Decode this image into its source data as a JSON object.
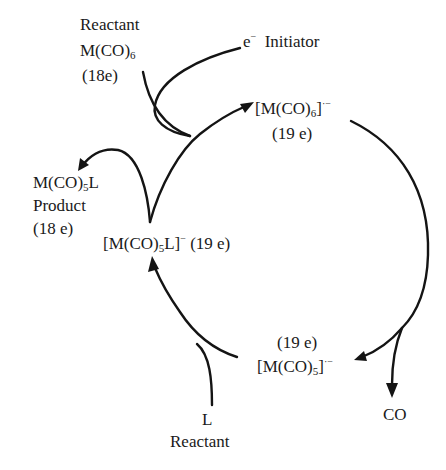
{
  "diagram": {
    "type": "catalytic-cycle",
    "topic": "Electron-transfer-chain (radical anion) ligand substitution",
    "nodes": {
      "reactant_mco6": {
        "role": "Reactant",
        "formula_main": "M(CO)",
        "formula_sub": "6",
        "electrons": "(18e)"
      },
      "initiator": {
        "symbol": "e",
        "charge": "−",
        "label": "Initiator"
      },
      "mco6_anion": {
        "formula_open": "[M(CO)",
        "formula_sub": "6",
        "formula_close": "]",
        "charge": "·−",
        "electrons": "(19 e)"
      },
      "mco5_anion": {
        "electrons": "(19 e)",
        "formula_open": "[M(CO)",
        "formula_sub": "5",
        "formula_close": "]",
        "charge": "·−"
      },
      "co_product": {
        "label": "CO"
      },
      "l_reactant": {
        "symbol": "L",
        "role": "Reactant"
      },
      "mco5l_anion": {
        "formula_open": "[M(CO)",
        "formula_sub": "5",
        "formula_close": "L]",
        "charge": "−",
        "electrons": "(19 e)"
      },
      "product_mco5l": {
        "formula_main": "M(CO)",
        "formula_sub": "5",
        "formula_tail": "L",
        "role": "Product",
        "electrons": "(18 e)"
      }
    },
    "edges": [
      {
        "from": "reactant_mco6",
        "to": "mco6_anion",
        "via": "initiator"
      },
      {
        "from": "mco6_anion",
        "to": "mco5_anion",
        "byproduct": "co_product"
      },
      {
        "from": "mco5_anion",
        "to": "mco5l_anion",
        "reagent": "l_reactant"
      },
      {
        "from": "mco5l_anion",
        "to": "mco6_anion",
        "reagent": "reactant_mco6"
      },
      {
        "from": "mco5l_anion",
        "to": "product_mco5l"
      }
    ],
    "colors": {
      "ink": "#141414",
      "background": "#ffffff"
    }
  }
}
